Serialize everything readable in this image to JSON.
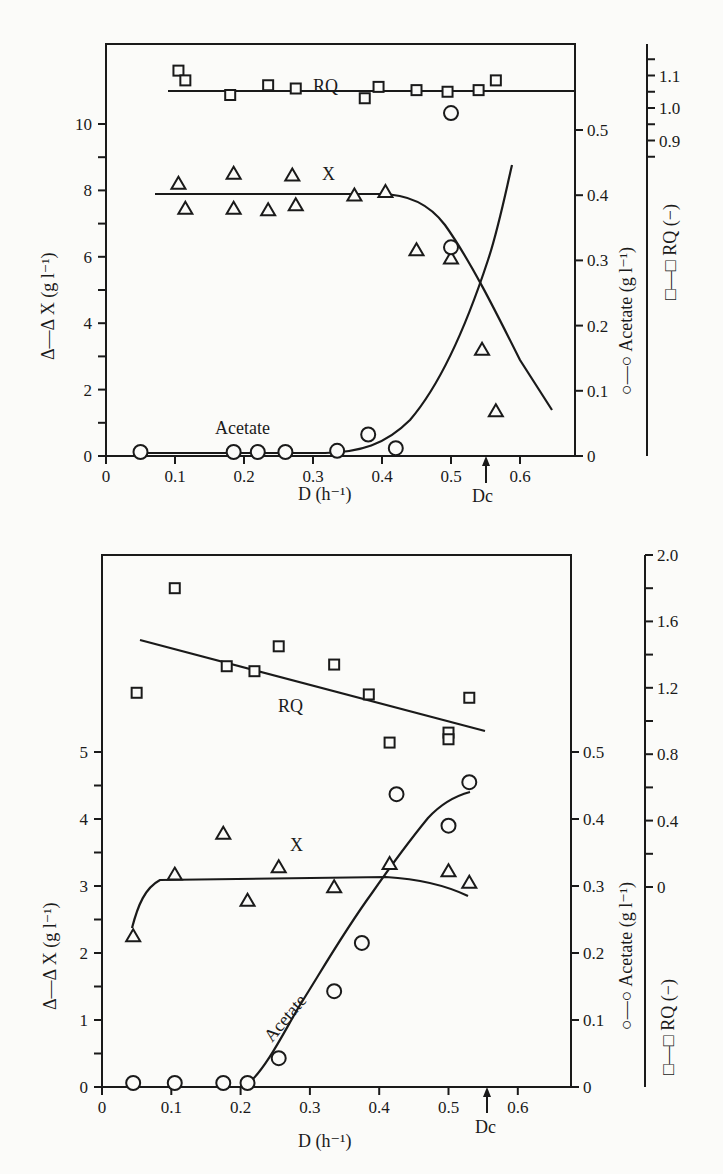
{
  "chart_data": [
    {
      "type": "scatter",
      "title": "",
      "xlabel": "D (h⁻¹)",
      "x_ticks": [
        "0",
        "0.1",
        "0.2",
        "0.3",
        "0.4",
        "0.5",
        "0.6"
      ],
      "xlim": [
        0,
        0.68
      ],
      "critical_marker": {
        "label": "Dc",
        "x": 0.555
      },
      "axes": {
        "left": {
          "label": "Δ—Δ X (g l⁻¹)",
          "ticks": [
            "0",
            "2",
            "4",
            "6",
            "8",
            "10"
          ],
          "range": [
            0,
            10
          ]
        },
        "right_acetate": {
          "label": "○—○ Acetate (g l⁻¹)",
          "ticks": [
            "0",
            "0.1",
            "0.2",
            "0.3",
            "0.4",
            "0.5"
          ],
          "range": [
            0,
            0.5
          ]
        },
        "right_rq": {
          "label": "□—□ RQ (−)",
          "ticks": [
            "0.9",
            "1.0",
            "1.1"
          ],
          "range": [
            0.9,
            1.1
          ]
        }
      },
      "series": [
        {
          "name": "X",
          "marker": "triangle",
          "axis": "left",
          "points": [
            [
              0.105,
              8.2
            ],
            [
              0.115,
              7.45
            ],
            [
              0.185,
              8.5
            ],
            [
              0.185,
              7.45
            ],
            [
              0.235,
              7.4
            ],
            [
              0.27,
              8.45
            ],
            [
              0.275,
              7.55
            ],
            [
              0.36,
              7.85
            ],
            [
              0.405,
              7.95
            ],
            [
              0.45,
              6.2
            ],
            [
              0.5,
              5.95
            ],
            [
              0.545,
              3.2
            ],
            [
              0.565,
              1.35
            ]
          ]
        },
        {
          "name": "Acetate",
          "marker": "circle",
          "axis": "right_acetate",
          "points": [
            [
              0.05,
              0.005
            ],
            [
              0.185,
              0.005
            ],
            [
              0.22,
              0.002
            ],
            [
              0.26,
              0.005
            ],
            [
              0.335,
              0.008
            ],
            [
              0.38,
              0.033
            ],
            [
              0.42,
              0.012
            ],
            [
              0.5,
              0.32
            ],
            [
              0.5,
              0.526
            ]
          ]
        },
        {
          "name": "RQ",
          "marker": "square",
          "axis": "right_rq",
          "points": [
            [
              0.105,
              1.115
            ],
            [
              0.115,
              1.085
            ],
            [
              0.18,
              1.04
            ],
            [
              0.235,
              1.07
            ],
            [
              0.275,
              1.06
            ],
            [
              0.375,
              1.03
            ],
            [
              0.395,
              1.065
            ],
            [
              0.45,
              1.055
            ],
            [
              0.495,
              1.05
            ],
            [
              0.54,
              1.055
            ],
            [
              0.565,
              1.085
            ]
          ]
        }
      ],
      "annotations": [
        "RQ",
        "X",
        "Acetate"
      ]
    },
    {
      "type": "scatter",
      "title": "",
      "xlabel": "D (h⁻¹)",
      "x_ticks": [
        "0",
        "0.1",
        "0.2",
        "0.3",
        "0.4",
        "0.5",
        "0.6"
      ],
      "xlim": [
        0,
        0.68
      ],
      "critical_marker": {
        "label": "Dc",
        "x": 0.555
      },
      "axes": {
        "left": {
          "label": "Δ—Δ X (g l⁻¹)",
          "ticks": [
            "0",
            "1",
            "2",
            "3",
            "4",
            "5"
          ],
          "range": [
            0,
            5
          ]
        },
        "right_acetate": {
          "label": "○—○ Acetate (g l⁻¹)",
          "ticks": [
            "0",
            "0.1",
            "0.2",
            "0.3",
            "0.4",
            "0.5"
          ],
          "range": [
            0,
            0.5
          ]
        },
        "right_rq": {
          "label": "□—□ RQ (−)",
          "ticks": [
            "0",
            "0.4",
            "0.8",
            "1.2",
            "1.6",
            "2.0"
          ],
          "range": [
            0,
            2.0
          ]
        }
      },
      "series": [
        {
          "name": "X",
          "marker": "triangle",
          "axis": "left",
          "points": [
            [
              0.045,
              2.25
            ],
            [
              0.105,
              3.17
            ],
            [
              0.175,
              3.78
            ],
            [
              0.21,
              2.78
            ],
            [
              0.255,
              3.28
            ],
            [
              0.335,
              2.98
            ],
            [
              0.415,
              3.33
            ],
            [
              0.5,
              3.22
            ],
            [
              0.53,
              3.05
            ]
          ]
        },
        {
          "name": "Acetate",
          "marker": "circle",
          "axis": "right_acetate",
          "points": [
            [
              0.045,
              0.002
            ],
            [
              0.105,
              0.0
            ],
            [
              0.175,
              0.0
            ],
            [
              0.21,
              0.0
            ],
            [
              0.255,
              0.043
            ],
            [
              0.335,
              0.143
            ],
            [
              0.375,
              0.215
            ],
            [
              0.425,
              0.437
            ],
            [
              0.5,
              0.39
            ],
            [
              0.53,
              0.455
            ]
          ]
        },
        {
          "name": "RQ",
          "marker": "square",
          "axis": "right_rq",
          "points": [
            [
              0.05,
              1.17
            ],
            [
              0.105,
              1.8
            ],
            [
              0.18,
              1.33
            ],
            [
              0.22,
              1.3
            ],
            [
              0.255,
              1.45
            ],
            [
              0.335,
              1.34
            ],
            [
              0.385,
              1.16
            ],
            [
              0.415,
              0.87
            ],
            [
              0.5,
              0.93
            ],
            [
              0.5,
              0.89
            ],
            [
              0.53,
              1.14
            ]
          ]
        }
      ],
      "annotations": [
        "RQ",
        "X",
        "Acetate"
      ]
    }
  ],
  "top": {
    "xlabel": "D (h⁻¹)",
    "dc": "Dc",
    "left_label": "Δ—Δ X (g l⁻¹)",
    "acetate_label": "○—○ Acetate (g l⁻¹)",
    "rq_label": "□—□ RQ (−)",
    "ann_rq": "RQ",
    "ann_x": "X",
    "ann_acetate": "Acetate"
  },
  "bottom": {
    "xlabel": "D (h⁻¹)",
    "dc": "Dc",
    "left_label": "Δ—Δ X (g l⁻¹)",
    "acetate_label": "○—○ Acetate (g l⁻¹)",
    "rq_label": "□—□ RQ (−)",
    "ann_rq": "RQ",
    "ann_x": "X",
    "ann_acetate": "Acetate"
  }
}
